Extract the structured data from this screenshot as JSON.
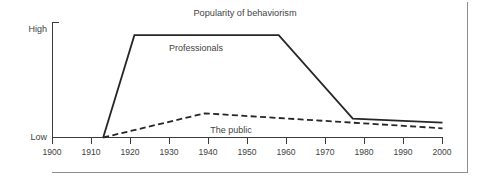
{
  "chart_data": {
    "type": "line",
    "title": "Popularity of behaviorism",
    "xlabel": "",
    "ylabel": "",
    "xlim": [
      1900,
      2000
    ],
    "ylim": [
      0,
      1
    ],
    "grid": false,
    "legend_position": "inline-labels",
    "x_tick_labels": [
      "1900",
      "1910",
      "1920",
      "1930",
      "1940",
      "1950",
      "1960",
      "1970",
      "1980",
      "1990",
      "2000"
    ],
    "x_ticks": [
      1900,
      1910,
      1920,
      1930,
      1940,
      1950,
      1960,
      1970,
      1980,
      1990,
      2000
    ],
    "y_tick_labels": [
      "Low",
      "High"
    ],
    "y_axis_low_label": "Low",
    "y_axis_high_label": "High",
    "series": [
      {
        "name": "Professionals",
        "style": "solid",
        "color": "#262626",
        "x": [
          1913,
          1921,
          1958,
          1977,
          2000
        ],
        "values": [
          0.0,
          0.89,
          0.89,
          0.165,
          0.13
        ]
      },
      {
        "name": "The public",
        "style": "dashed",
        "color": "#262626",
        "x": [
          1913,
          1939,
          2000
        ],
        "values": [
          0.0,
          0.21,
          0.08
        ]
      }
    ],
    "annotations": [
      {
        "text": "Professionals",
        "x": 1932,
        "y": 0.8
      },
      {
        "text": "The public",
        "x": 1941,
        "y": 0.1
      }
    ]
  },
  "figure": {
    "title": "Popularity of behaviorism",
    "axis": {
      "y_high": "High",
      "y_low": "Low"
    },
    "x_labels": {
      "t0": "1900",
      "t1": "1910",
      "t2": "1920",
      "t3": "1930",
      "t4": "1940",
      "t5": "1950",
      "t6": "1960",
      "t7": "1970",
      "t8": "1980",
      "t9": "1990",
      "t10": "2000"
    },
    "series_labels": {
      "professionals": "Professionals",
      "public": "The public"
    },
    "colors": {
      "line": "#262626",
      "axis": "#3a3a3a",
      "frame": "#8e8e8e",
      "text": "#3f3f3f",
      "background": "#ffffff"
    }
  }
}
